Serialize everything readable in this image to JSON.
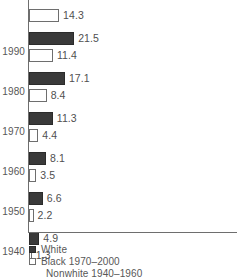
{
  "chart_data": {
    "type": "bar",
    "orientation": "horizontal",
    "title": "",
    "xlabel": "",
    "ylabel": "",
    "grid": false,
    "xlim": [
      0,
      24
    ],
    "categories": [
      "2000",
      "1990",
      "1980",
      "1970",
      "1960",
      "1950",
      "1940"
    ],
    "tick_labels": [
      "",
      "1990",
      "1980",
      "1970",
      "1960",
      "1950",
      "1940"
    ],
    "series": [
      {
        "name": "White",
        "color": "#3a3a3a",
        "style": "filled",
        "values": [
          null,
          21.5,
          17.1,
          11.3,
          8.1,
          6.6,
          4.9
        ]
      },
      {
        "name": "Black 1970-2000 / Nonwhite 1940-1960",
        "color": "#ffffff",
        "style": "hollow",
        "values": [
          14.3,
          11.4,
          8.4,
          4.4,
          3.5,
          2.2,
          1.3
        ]
      }
    ],
    "legend": {
      "position": "bottom-left",
      "entries": [
        {
          "label": "White",
          "swatch": "filled"
        },
        {
          "label": "Black 1970–2000",
          "swatch": "hollow"
        },
        {
          "label": "Nonwhite 1940–1960",
          "swatch": "none"
        }
      ]
    }
  },
  "groups": [
    {
      "year": "",
      "dark": {
        "label": "",
        "value": 0,
        "visible": false
      },
      "light": {
        "label": "14.3",
        "value": 14.3,
        "visible": true
      }
    },
    {
      "year": "1990",
      "dark": {
        "label": "21.5",
        "value": 21.5,
        "visible": true
      },
      "light": {
        "label": "11.4",
        "value": 11.4,
        "visible": true
      }
    },
    {
      "year": "1980",
      "dark": {
        "label": "17.1",
        "value": 17.1,
        "visible": true
      },
      "light": {
        "label": "8.4",
        "value": 8.4,
        "visible": true
      }
    },
    {
      "year": "1970",
      "dark": {
        "label": "11.3",
        "value": 11.3,
        "visible": true
      },
      "light": {
        "label": "4.4",
        "value": 4.4,
        "visible": true
      }
    },
    {
      "year": "1960",
      "dark": {
        "label": "8.1",
        "value": 8.1,
        "visible": true
      },
      "light": {
        "label": "3.5",
        "value": 3.5,
        "visible": true
      }
    },
    {
      "year": "1950",
      "dark": {
        "label": "6.6",
        "value": 6.6,
        "visible": true
      },
      "light": {
        "label": "2.2",
        "value": 2.2,
        "visible": true
      }
    },
    {
      "year": "1940",
      "dark": {
        "label": "4.9",
        "value": 4.9,
        "visible": true
      },
      "light": {
        "label": "1.3",
        "value": 1.3,
        "visible": true
      }
    }
  ],
  "legend": {
    "entries": [
      {
        "label": "White",
        "swatch": "filled"
      },
      {
        "label": "Black 1970–2000",
        "swatch": "hollow"
      },
      {
        "label": "Nonwhite 1940–1960",
        "swatch": "none"
      }
    ]
  },
  "colors": {
    "dark_bar": "#3a3a3a",
    "dark_bar_edge": "#2b2b2b",
    "light_bar": "#ffffff",
    "light_bar_edge": "#6e6e6e",
    "axis": "#6e6e6e",
    "text": "#575757"
  }
}
